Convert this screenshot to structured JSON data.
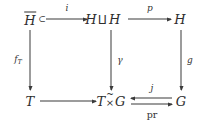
{
  "diagram": {
    "type": "commutative-diagram",
    "background_color": "#ffffff",
    "ink_color": "#2e2e2e",
    "nodes": [
      {
        "id": "n_hbar",
        "latex": "\\overline{\\mathcal{H}}",
        "base": "H",
        "accent": "overline",
        "row": 0,
        "col": 0
      },
      {
        "id": "n_hamalgh",
        "latex": "\\mathcal{H}\\amalg\\mathcal{H}",
        "left": "H",
        "op": "⨿",
        "right": "H",
        "row": 0,
        "col": 1
      },
      {
        "id": "n_h",
        "latex": "\\mathcal{H}",
        "base": "H",
        "row": 0,
        "col": 2
      },
      {
        "id": "n_t",
        "latex": "\\mathcal{T}",
        "base": "T",
        "row": 1,
        "col": 0
      },
      {
        "id": "n_txg",
        "latex": "\\mathcal{T}\\tilde{\\times}\\mathcal{G}",
        "left": "T",
        "op": "×",
        "op_accent": "~",
        "right": "G",
        "row": 1,
        "col": 1
      },
      {
        "id": "n_g",
        "latex": "\\mathcal{G}",
        "base": "G",
        "row": 1,
        "col": 2
      }
    ],
    "arrows": [
      {
        "id": "a_i",
        "from": "n_hbar",
        "to": "n_hamalgh",
        "label": "i",
        "label_position": "above",
        "style": "hook-right",
        "direction": "right"
      },
      {
        "id": "a_p",
        "from": "n_hamalgh",
        "to": "n_h",
        "label": "p",
        "label_position": "above",
        "style": "plain",
        "direction": "right"
      },
      {
        "id": "a_fT",
        "from": "n_hbar",
        "to": "n_t",
        "label": "f",
        "label_sub": "T",
        "label_position": "left",
        "style": "plain",
        "direction": "down"
      },
      {
        "id": "a_gam",
        "from": "n_hamalgh",
        "to": "n_txg",
        "label": "γ",
        "label_position": "right",
        "style": "plain",
        "direction": "down"
      },
      {
        "id": "a_g",
        "from": "n_h",
        "to": "n_g",
        "label": "g",
        "label_position": "right",
        "style": "plain",
        "direction": "down"
      },
      {
        "id": "a_bot",
        "from": "n_t",
        "to": "n_txg",
        "label": "",
        "label_position": "above",
        "style": "plain",
        "direction": "right"
      },
      {
        "id": "a_j",
        "from": "n_g",
        "to": "n_txg",
        "label": "j",
        "label_position": "above",
        "style": "plain",
        "direction": "left"
      },
      {
        "id": "a_pr",
        "from": "n_txg",
        "to": "n_g",
        "label": "pr",
        "label_position": "below",
        "style": "plain",
        "direction": "right",
        "upright": true
      }
    ]
  }
}
